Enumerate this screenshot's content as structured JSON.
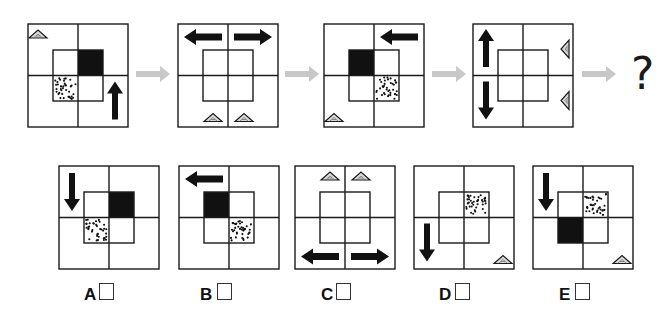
{
  "question": {
    "sequence": [
      {
        "id": "figure-1",
        "arrows": [
          {
            "cell": "bottom-right",
            "direction": "up"
          }
        ],
        "triangles": [
          {
            "cell": "top-left",
            "corner": "top-left",
            "pointing": "up"
          }
        ],
        "inner_fills": {
          "top-right": "black",
          "bottom-left": "dotted"
        }
      },
      {
        "id": "figure-2",
        "arrows": [
          {
            "cell": "top-left",
            "direction": "left"
          },
          {
            "cell": "top-right",
            "direction": "right"
          }
        ],
        "triangles": [
          {
            "cell": "bottom-left",
            "corner": "bottom-center",
            "pointing": "up"
          },
          {
            "cell": "bottom-right",
            "corner": "bottom-center",
            "pointing": "up"
          }
        ],
        "inner_fills": {}
      },
      {
        "id": "figure-3",
        "arrows": [
          {
            "cell": "top-right",
            "direction": "left"
          }
        ],
        "triangles": [
          {
            "cell": "bottom-left",
            "corner": "bottom-left",
            "pointing": "up"
          }
        ],
        "inner_fills": {
          "top-left": "black",
          "bottom-right": "dotted"
        }
      },
      {
        "id": "figure-4",
        "arrows": [
          {
            "cell": "top-left",
            "direction": "up"
          },
          {
            "cell": "bottom-left",
            "direction": "down"
          }
        ],
        "triangles": [
          {
            "cell": "top-right",
            "corner": "right-center",
            "pointing": "left"
          },
          {
            "cell": "bottom-right",
            "corner": "right-center",
            "pointing": "left"
          }
        ],
        "inner_fills": {}
      }
    ],
    "unknown_symbol": "?"
  },
  "options": [
    {
      "label": "A",
      "arrows": [
        {
          "cell": "top-left",
          "direction": "down"
        }
      ],
      "triangles": [],
      "inner_fills": {
        "top-right": "black",
        "bottom-left": "dotted"
      }
    },
    {
      "label": "B",
      "arrows": [
        {
          "cell": "top-left",
          "direction": "left"
        }
      ],
      "triangles": [],
      "inner_fills": {
        "top-left": "black",
        "bottom-right": "dotted"
      }
    },
    {
      "label": "C",
      "arrows": [
        {
          "cell": "bottom-left",
          "direction": "left"
        },
        {
          "cell": "bottom-right",
          "direction": "right"
        }
      ],
      "triangles": [
        {
          "cell": "top-left",
          "corner": "top-center",
          "pointing": "up"
        },
        {
          "cell": "top-right",
          "corner": "top-center",
          "pointing": "up"
        }
      ],
      "inner_fills": {}
    },
    {
      "label": "D",
      "arrows": [
        {
          "cell": "bottom-left",
          "direction": "down"
        }
      ],
      "triangles": [
        {
          "cell": "bottom-right",
          "corner": "bottom-right",
          "pointing": "up"
        }
      ],
      "inner_fills": {
        "top-right": "dotted"
      }
    },
    {
      "label": "E",
      "arrows": [
        {
          "cell": "top-left",
          "direction": "down"
        }
      ],
      "triangles": [
        {
          "cell": "bottom-right",
          "corner": "bottom-right",
          "pointing": "up"
        }
      ],
      "inner_fills": {
        "top-right": "dotted",
        "bottom-left": "black"
      }
    }
  ],
  "colors": {
    "line": "#1a1a1a",
    "fill_black": "#111111",
    "flow_arrow": "#c8c8c8",
    "triangle_fill": "#d9d9d9"
  }
}
